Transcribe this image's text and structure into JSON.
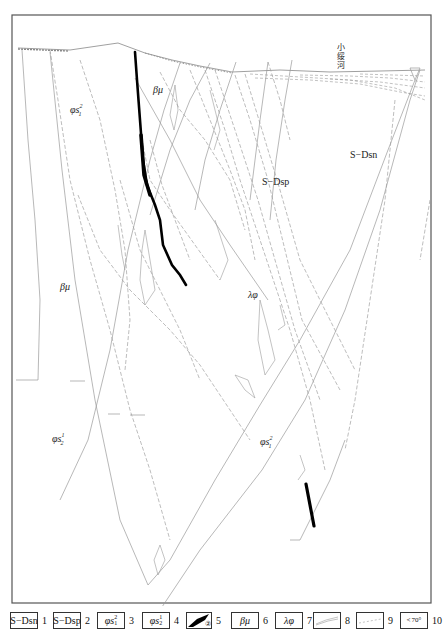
{
  "diagram": {
    "type": "geological-cross-section",
    "frame_color": "#555555",
    "line_color": "#9a9a9a",
    "vein_color": "#000000",
    "river_label": "小绥河",
    "unit_labels": [
      {
        "id": "phis1-2-top",
        "text": "φs",
        "sup": "2",
        "sub": "1",
        "x": 70,
        "y": 113
      },
      {
        "id": "beta-mu-top",
        "text": "βμ",
        "x": 160,
        "y": 93
      },
      {
        "id": "s-dsp",
        "text": "S−Dsp",
        "x": 262,
        "y": 185
      },
      {
        "id": "s-dsn",
        "text": "S−Dsn",
        "x": 350,
        "y": 158
      },
      {
        "id": "beta-mu-left",
        "text": "βμ",
        "x": 62,
        "y": 290
      },
      {
        "id": "lambda-phi",
        "text": "λφ",
        "x": 250,
        "y": 298
      },
      {
        "id": "phis2-1-left",
        "text": "φs",
        "sup": "1",
        "sub": "2",
        "x": 52,
        "y": 442
      },
      {
        "id": "phis1-2-bottom",
        "text": "φs",
        "sup": "2",
        "sub": "1",
        "x": 260,
        "y": 445
      }
    ]
  },
  "legend": {
    "items": [
      {
        "num": "1",
        "label": "S−Dsn",
        "kind": "text"
      },
      {
        "num": "2",
        "label": "S−Dsp",
        "kind": "text"
      },
      {
        "num": "3",
        "label": "φs",
        "sup": "2",
        "sub": "1",
        "kind": "formula"
      },
      {
        "num": "4",
        "label": "φs",
        "sup": "1",
        "sub": "2",
        "kind": "formula"
      },
      {
        "num": "5",
        "label": "②",
        "kind": "vein-symbol"
      },
      {
        "num": "6",
        "label": "βμ",
        "kind": "italic"
      },
      {
        "num": "7",
        "label": "λφ",
        "kind": "italic"
      },
      {
        "num": "8",
        "label": "",
        "kind": "solid-line-symbol"
      },
      {
        "num": "9",
        "label": "",
        "kind": "dashed-line-symbol"
      },
      {
        "num": "10",
        "label": "70°",
        "kind": "dip-symbol"
      }
    ]
  }
}
